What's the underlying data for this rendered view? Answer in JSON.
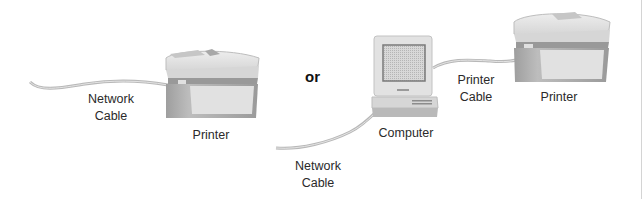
{
  "diagram": {
    "left_option": {
      "cable_label_line1": "Network",
      "cable_label_line2": "Cable",
      "device_label": "Printer"
    },
    "separator": "or",
    "right_option": {
      "network_cable_label_line1": "Network",
      "network_cable_label_line2": "Cable",
      "computer_label": "Computer",
      "printer_cable_label_line1": "Printer",
      "printer_cable_label_line2": "Cable",
      "printer_label": "Printer"
    }
  },
  "colors": {
    "cable": "#c4c4c4",
    "printer_light": "#e6e6e6",
    "printer_mid": "#bdbdbd",
    "printer_dark": "#8f8f8f",
    "computer_body": "#dcdcdc",
    "screen": "#bcbcbc"
  }
}
